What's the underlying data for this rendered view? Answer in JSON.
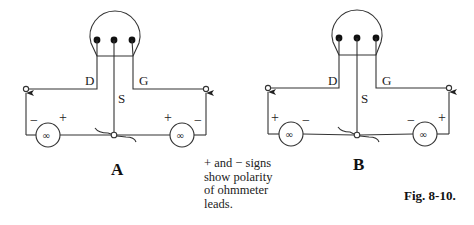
{
  "figure": {
    "caption": "Fig. 8-10.",
    "note_lines": [
      "+ and − signs",
      "show polarity",
      "of ohmmeter",
      "leads."
    ],
    "panels": [
      {
        "id": "A",
        "label": "A",
        "lead_labels": {
          "drain": "D",
          "gate": "G",
          "source": "S"
        },
        "left_meter": {
          "reading": "∞",
          "left_sign": "−",
          "right_sign": "+"
        },
        "right_meter": {
          "reading": "∞",
          "left_sign": "+",
          "right_sign": "−"
        }
      },
      {
        "id": "B",
        "label": "B",
        "lead_labels": {
          "drain": "D",
          "gate": "G",
          "source": "S"
        },
        "left_meter": {
          "reading": "∞",
          "left_sign": "+",
          "right_sign": "−"
        },
        "right_meter": {
          "reading": "∞",
          "left_sign": "−",
          "right_sign": "+"
        }
      }
    ],
    "icons": {
      "transistor": "fet-transistor-icon",
      "meter": "ohmmeter-icon",
      "probe": "probe-arrow-icon",
      "terminal": "terminal-circle-icon"
    },
    "colors": {
      "line": "#333333",
      "background": "#ffffff"
    }
  }
}
